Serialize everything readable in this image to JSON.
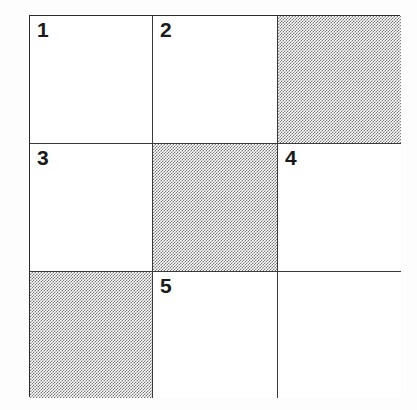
{
  "figure": {
    "kind": "grid-diagram",
    "rows": 3,
    "columns": 3,
    "border_color": "#2b2b2b",
    "grid_line_color": "#3a3a3a",
    "shade_color": "#5e5e5e",
    "background_color": "#ffffff",
    "label_color": "#1a1a1a"
  },
  "cells": [
    {
      "row": 1,
      "col": 1,
      "label": "1",
      "shaded": false
    },
    {
      "row": 1,
      "col": 2,
      "label": "2",
      "shaded": false
    },
    {
      "row": 1,
      "col": 3,
      "label": "",
      "shaded": true
    },
    {
      "row": 2,
      "col": 1,
      "label": "3",
      "shaded": false
    },
    {
      "row": 2,
      "col": 2,
      "label": "",
      "shaded": true
    },
    {
      "row": 2,
      "col": 3,
      "label": "4",
      "shaded": false
    },
    {
      "row": 3,
      "col": 1,
      "label": "",
      "shaded": true
    },
    {
      "row": 3,
      "col": 2,
      "label": "5",
      "shaded": false
    },
    {
      "row": 3,
      "col": 3,
      "label": "",
      "shaded": false
    }
  ]
}
